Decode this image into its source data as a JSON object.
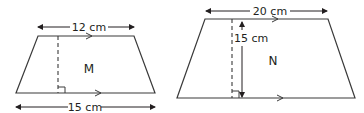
{
  "colors": {
    "line": "#3a3a3a",
    "text": "#231f20",
    "background": "#ffffff"
  },
  "shapes": [
    {
      "id": "M",
      "label": "M",
      "type": "trapezoid",
      "top_base": "12 cm",
      "bottom_base": "15 cm",
      "height_marker": "dashed perpendicular with right-angle mark",
      "parallel_marks": "arrowheads on top and bottom sides"
    },
    {
      "id": "N",
      "label": "N",
      "type": "trapezoid",
      "top_base": "20 cm",
      "height": "15 cm",
      "height_marker": "dashed perpendicular with right-angle mark and height arrow",
      "parallel_marks": "arrowheads on top and bottom sides"
    }
  ]
}
